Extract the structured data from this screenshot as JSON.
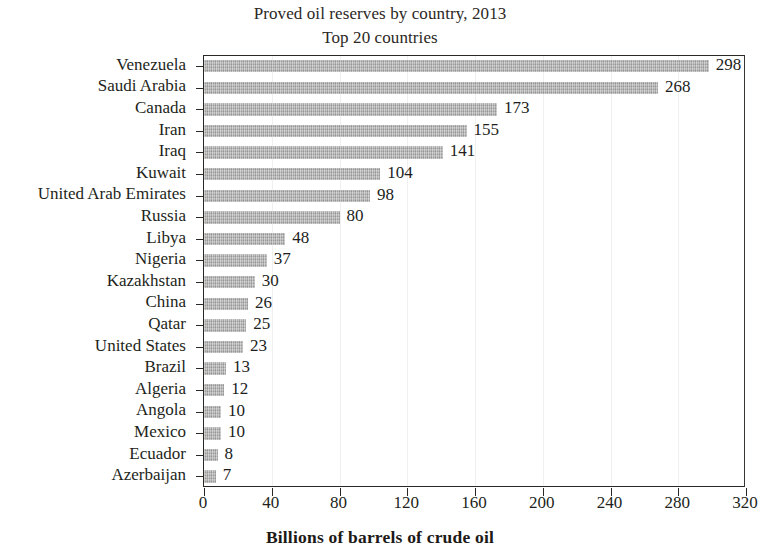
{
  "chart_data": {
    "type": "bar",
    "orientation": "horizontal",
    "title": "Proved oil reserves by country, 2013",
    "subtitle": "Top 20 countries",
    "xlabel": "Billions of barrels of crude oil",
    "ylabel": "",
    "xlim": [
      0,
      320
    ],
    "xticks": [
      0,
      40,
      80,
      120,
      160,
      200,
      240,
      280,
      320
    ],
    "grid": "vertical-faint",
    "legend": "none",
    "bar_color": "#b2b2b2",
    "categories": [
      "Venezuela",
      "Saudi Arabia",
      "Canada",
      "Iran",
      "Iraq",
      "Kuwait",
      "United Arab Emirates",
      "Russia",
      "Libya",
      "Nigeria",
      "Kazakhstan",
      "China",
      "Qatar",
      "United States",
      "Brazil",
      "Algeria",
      "Angola",
      "Mexico",
      "Ecuador",
      "Azerbaijan"
    ],
    "values": [
      298,
      268,
      173,
      155,
      141,
      104,
      98,
      80,
      48,
      37,
      30,
      26,
      25,
      23,
      13,
      12,
      10,
      10,
      8,
      7
    ],
    "value_labels": [
      "298",
      "268",
      "173",
      "155",
      "141",
      "104",
      "98",
      "80",
      "48",
      "37",
      "30",
      "26",
      "25",
      "23",
      "13",
      "12",
      "10",
      "10",
      "8",
      "7"
    ],
    "xtick_labels": [
      "0",
      "40",
      "80",
      "120",
      "160",
      "200",
      "240",
      "280",
      "320"
    ]
  }
}
